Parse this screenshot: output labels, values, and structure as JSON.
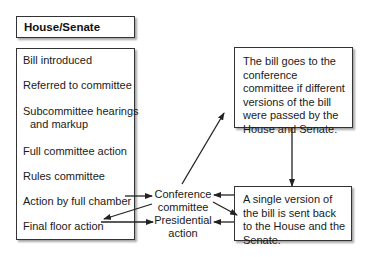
{
  "header": {
    "title": "House/Senate"
  },
  "steps": [
    {
      "label": "Bill introduced"
    },
    {
      "label": "Referred to committee"
    },
    {
      "label": "Subcommittee hearings",
      "label2": "and markup"
    },
    {
      "label": "Full committee action"
    },
    {
      "label": "Rules committee"
    },
    {
      "label": "Action by full chamber"
    },
    {
      "label": "Final floor action"
    }
  ],
  "nodes": {
    "conference": {
      "line1": "Conference",
      "line2": "committee"
    },
    "presidential": {
      "line1": "Presidential",
      "line2": "action"
    }
  },
  "notes": {
    "top_right": "The bill goes to the conference committee if different versions of the bill were passed by the House and Senate.",
    "bottom_right": "A single version of the bill is sent back to the House and the Senate."
  },
  "edges": [
    {
      "from": "Action by full chamber",
      "to": "Conference committee"
    },
    {
      "from": "Conference committee",
      "to": "Final floor action"
    },
    {
      "from": "Final floor action",
      "to": "Presidential action"
    },
    {
      "from": "Conference committee",
      "to": "The bill goes to the conference committee..."
    },
    {
      "from": "The bill goes to the conference committee...",
      "to": "A single version of the bill..."
    },
    {
      "from": "Conference committee",
      "to": "A single version of the bill..."
    },
    {
      "from": "A single version of the bill...",
      "to": "Conference committee"
    },
    {
      "from": "A single version of the bill...",
      "to": "Presidential action"
    }
  ],
  "colors": {
    "line": "#222222",
    "border": "#333333",
    "background": "#ffffff"
  }
}
